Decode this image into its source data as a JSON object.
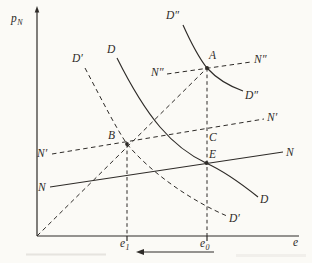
{
  "figure": {
    "type": "economics-diagram",
    "colors": {
      "background": "#fbfaf6",
      "ink": "#2e2b28"
    },
    "axes": {
      "y_letter": "p",
      "y_sub": "N",
      "x_letter": "e"
    },
    "x_ticks": {
      "e1_letter": "e",
      "e1_sub": "1",
      "e0_letter": "e",
      "e0_sub": "0"
    },
    "labels": {
      "D": "D",
      "D_prime": "D′",
      "D_dprime": "D″",
      "N": "N",
      "N_prime": "N′",
      "N_dprime": "N″",
      "A": "A",
      "B": "B",
      "C": "C",
      "E": "E"
    }
  }
}
